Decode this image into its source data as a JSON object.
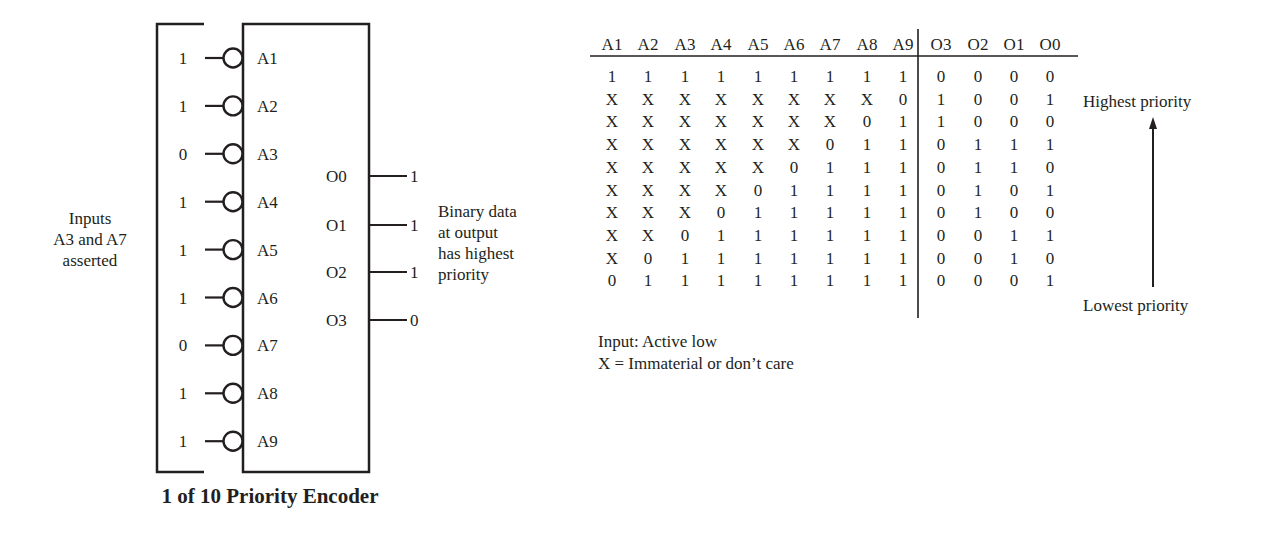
{
  "encoder": {
    "title": "1 of 10 Priority Encoder",
    "left_annotation": [
      "Inputs",
      "A3 and A7",
      "asserted"
    ],
    "right_annotation": [
      "Binary data",
      "at output",
      "has highest",
      "priority"
    ],
    "inputs": [
      {
        "pin": "A1",
        "value": "1"
      },
      {
        "pin": "A2",
        "value": "1"
      },
      {
        "pin": "A3",
        "value": "0"
      },
      {
        "pin": "A4",
        "value": "1"
      },
      {
        "pin": "A5",
        "value": "1"
      },
      {
        "pin": "A6",
        "value": "1"
      },
      {
        "pin": "A7",
        "value": "0"
      },
      {
        "pin": "A8",
        "value": "1"
      },
      {
        "pin": "A9",
        "value": "1"
      }
    ],
    "outputs": [
      {
        "pin": "O0",
        "value": "1"
      },
      {
        "pin": "O1",
        "value": "1"
      },
      {
        "pin": "O2",
        "value": "1"
      },
      {
        "pin": "O3",
        "value": "0"
      }
    ]
  },
  "truth_table": {
    "headers": [
      "A1",
      "A2",
      "A3",
      "A4",
      "A5",
      "A6",
      "A7",
      "A8",
      "A9",
      "O3",
      "O2",
      "O1",
      "O0"
    ],
    "rows": [
      [
        "1",
        "1",
        "1",
        "1",
        "1",
        "1",
        "1",
        "1",
        "1",
        "0",
        "0",
        "0",
        "0"
      ],
      [
        "X",
        "X",
        "X",
        "X",
        "X",
        "X",
        "X",
        "X",
        "0",
        "1",
        "0",
        "0",
        "1"
      ],
      [
        "X",
        "X",
        "X",
        "X",
        "X",
        "X",
        "X",
        "0",
        "1",
        "1",
        "0",
        "0",
        "0"
      ],
      [
        "X",
        "X",
        "X",
        "X",
        "X",
        "X",
        "0",
        "1",
        "1",
        "0",
        "1",
        "1",
        "1"
      ],
      [
        "X",
        "X",
        "X",
        "X",
        "X",
        "0",
        "1",
        "1",
        "1",
        "0",
        "1",
        "1",
        "0"
      ],
      [
        "X",
        "X",
        "X",
        "X",
        "0",
        "1",
        "1",
        "1",
        "1",
        "0",
        "1",
        "0",
        "1"
      ],
      [
        "X",
        "X",
        "X",
        "0",
        "1",
        "1",
        "1",
        "1",
        "1",
        "0",
        "1",
        "0",
        "0"
      ],
      [
        "X",
        "X",
        "0",
        "1",
        "1",
        "1",
        "1",
        "1",
        "1",
        "0",
        "0",
        "1",
        "1"
      ],
      [
        "X",
        "0",
        "1",
        "1",
        "1",
        "1",
        "1",
        "1",
        "1",
        "0",
        "0",
        "1",
        "0"
      ],
      [
        "0",
        "1",
        "1",
        "1",
        "1",
        "1",
        "1",
        "1",
        "1",
        "0",
        "0",
        "0",
        "1"
      ]
    ],
    "highest_label": "Highest priority",
    "lowest_label": "Lowest priority",
    "notes": [
      "Input: Active low",
      "X = Immaterial or don’t care"
    ]
  },
  "colors": {
    "ink": "#231f20",
    "background": "#ffffff"
  }
}
